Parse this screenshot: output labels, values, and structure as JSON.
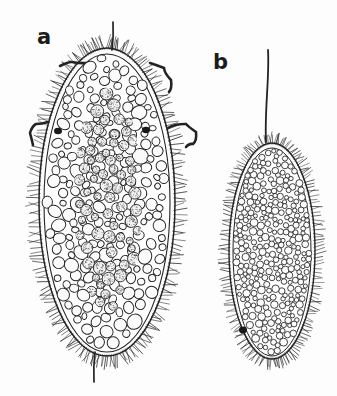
{
  "figure": {
    "domain": "scientific-illustration",
    "background_color": "#fdfdfd",
    "ink_color": "#232323",
    "width": 337,
    "height": 396,
    "labels": [
      {
        "id": "a",
        "text": "a",
        "x": 37,
        "y": 27
      },
      {
        "id": "b",
        "text": "b",
        "x": 213,
        "y": 52
      }
    ],
    "specimens": [
      {
        "id": "a",
        "label": "a",
        "description": "Large ovoid ciliate body, ciliated margin, vacuolated cortex with coarse clear vesicles and a dark stippled central endoplasm core, with curved hook-like cirri and apical plus caudal flagella.",
        "body": {
          "center_x": 107,
          "center_y": 202,
          "radius_x": 68,
          "radius_y": 154,
          "outline_stroke": "#232323"
        },
        "inner_core": {
          "center_x": 108,
          "center_y": 200,
          "radius_x": 34,
          "radius_y": 112,
          "fill_tone": "stippled-dark"
        },
        "cilia": {
          "count": 230,
          "length": 13,
          "style": "fine-hatch"
        },
        "vesicles": {
          "count": 210,
          "size_min": 6,
          "size_max": 15
        },
        "granules": {
          "count": 70,
          "size_min": 7,
          "size_max": 13
        },
        "flagella": [
          {
            "name": "apical-flagellum",
            "x1": 113,
            "y1": 22,
            "x2": 112,
            "y2": 50
          },
          {
            "name": "caudal-flagellum",
            "x1": 95,
            "y1": 352,
            "x2": 94,
            "y2": 382
          }
        ],
        "cirri": [
          {
            "name": "cirrus-upper-left",
            "points": "60,66 72,62 86,63 96,67"
          },
          {
            "name": "cirrus-upper-right",
            "points": "150,63 164,68 171,80 169,92"
          },
          {
            "name": "cirrus-mid-right",
            "points": "168,128 186,124 196,132 193,144 186,147"
          },
          {
            "name": "cirrus-mid-left",
            "points": "48,122 36,124 30,133 33,145"
          }
        ],
        "dark_spots": [
          {
            "name": "pigment-spot-left",
            "x": 58,
            "y": 131,
            "r": 4
          },
          {
            "name": "pigment-spot-right",
            "x": 146,
            "y": 130,
            "r": 4
          }
        ]
      },
      {
        "id": "b",
        "label": "b",
        "description": "Smaller elongated ovoid ciliate body, densely packed fine uniform circular vesicles throughout, ciliated margin, single long apical flagellum and a dark pigment spot near the base.",
        "body": {
          "center_x": 272,
          "center_y": 251,
          "radius_x": 43,
          "radius_y": 108,
          "outline_stroke": "#232323"
        },
        "cilia": {
          "count": 190,
          "length": 11,
          "style": "fine-hatch"
        },
        "vesicles": {
          "count": 430,
          "size_min": 4,
          "size_max": 8
        },
        "flagella": [
          {
            "name": "apical-flagellum",
            "x1": 268,
            "y1": 50,
            "x2": 266,
            "y2": 142
          }
        ],
        "dark_spots": [
          {
            "name": "pigment-spot-base",
            "x": 243,
            "y": 330,
            "r": 4
          }
        ]
      }
    ]
  }
}
